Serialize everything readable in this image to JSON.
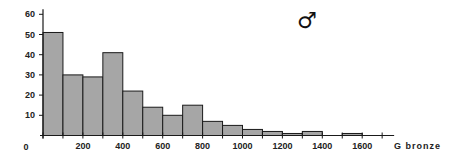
{
  "chart_data": {
    "type": "bar",
    "title": "",
    "annotation": "♂",
    "xlabel": "G bronze",
    "ylabel": "",
    "bin_width": 100,
    "bins": [
      {
        "start": 0,
        "end": 100,
        "value": 51
      },
      {
        "start": 100,
        "end": 200,
        "value": 30
      },
      {
        "start": 200,
        "end": 300,
        "value": 29
      },
      {
        "start": 300,
        "end": 400,
        "value": 41
      },
      {
        "start": 400,
        "end": 500,
        "value": 22
      },
      {
        "start": 500,
        "end": 600,
        "value": 14
      },
      {
        "start": 600,
        "end": 700,
        "value": 10
      },
      {
        "start": 700,
        "end": 800,
        "value": 15
      },
      {
        "start": 800,
        "end": 900,
        "value": 7
      },
      {
        "start": 900,
        "end": 1000,
        "value": 5
      },
      {
        "start": 1000,
        "end": 1100,
        "value": 3
      },
      {
        "start": 1100,
        "end": 1200,
        "value": 2
      },
      {
        "start": 1200,
        "end": 1300,
        "value": 1
      },
      {
        "start": 1300,
        "end": 1400,
        "value": 2
      },
      {
        "start": 1400,
        "end": 1500,
        "value": 0
      },
      {
        "start": 1500,
        "end": 1600,
        "value": 1
      }
    ],
    "categories": [
      "0-100",
      "100-200",
      "200-300",
      "300-400",
      "400-500",
      "500-600",
      "600-700",
      "700-800",
      "800-900",
      "900-1000",
      "1000-1100",
      "1100-1200",
      "1200-1300",
      "1300-1400",
      "1400-1500",
      "1500-1600"
    ],
    "values": [
      51,
      30,
      29,
      41,
      22,
      14,
      10,
      15,
      7,
      5,
      3,
      2,
      1,
      2,
      0,
      1
    ],
    "xlim": [
      0,
      1740
    ],
    "ylim": [
      0,
      62
    ],
    "x_tick_labels": [
      "0",
      "200",
      "400",
      "600",
      "800",
      "1000",
      "1200",
      "1400",
      "1600"
    ],
    "x_ticks": [
      0,
      100,
      200,
      300,
      400,
      500,
      600,
      700,
      800,
      900,
      1000,
      1100,
      1200,
      1300,
      1400,
      1500,
      1600,
      1700
    ],
    "y_tick_labels": [
      "10",
      "20",
      "30",
      "40",
      "50",
      "60"
    ],
    "y_ticks": [
      0,
      10,
      20,
      30,
      40,
      50,
      60
    ],
    "grid": false,
    "legend": null,
    "colors": {
      "bar_fill": "#a6a6a6",
      "bar_stroke": "#1a1a1a",
      "axis": "#1a1a1a"
    }
  }
}
